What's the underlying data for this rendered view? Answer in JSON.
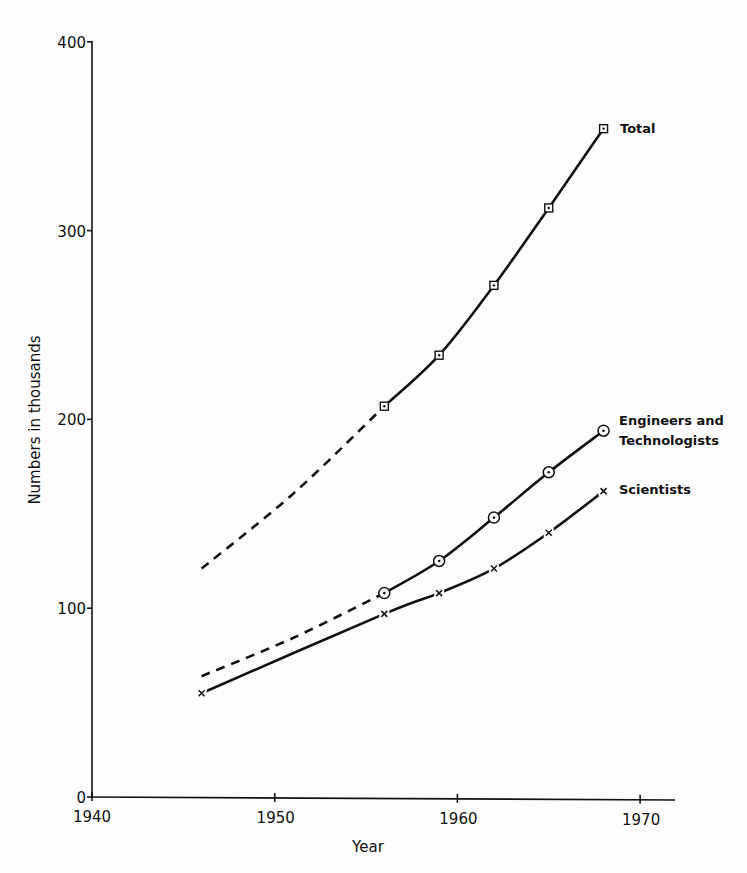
{
  "chart_data": {
    "type": "line",
    "title": "",
    "xlabel": "Year",
    "ylabel": "Numbers in thousands",
    "xlim": [
      1940,
      1972
    ],
    "ylim": [
      0,
      400
    ],
    "x_ticks": [
      1940,
      1950,
      1960,
      1970
    ],
    "x_tick_labels": [
      "1940",
      "1950",
      "1960",
      "1970"
    ],
    "y_ticks": [
      0,
      100,
      200,
      300,
      400
    ],
    "y_tick_labels": [
      "0",
      "100",
      "200",
      "300",
      "400"
    ],
    "grid": false,
    "legend_position": "inline labels at right end of each line",
    "series": [
      {
        "name": "Total",
        "marker": "square-dot",
        "estimated_start": {
          "x": 1946,
          "y": 121
        },
        "dashed_segment": [
          [
            1946,
            121
          ],
          [
            1956,
            207
          ]
        ],
        "x": [
          1956,
          1959,
          1962,
          1965,
          1968
        ],
        "values": [
          207,
          234,
          271,
          312,
          354
        ]
      },
      {
        "name": "Engineers and Technologists",
        "marker": "circle-dot",
        "estimated_start": {
          "x": 1946,
          "y": 64
        },
        "dashed_segment": [
          [
            1946,
            64
          ],
          [
            1956,
            108
          ]
        ],
        "x": [
          1956,
          1959,
          1962,
          1965,
          1968
        ],
        "values": [
          108,
          125,
          148,
          172,
          194
        ]
      },
      {
        "name": "Scientists",
        "marker": "x",
        "x": [
          1946,
          1956,
          1959,
          1962,
          1965,
          1968
        ],
        "values": [
          55,
          97,
          108,
          121,
          140,
          162
        ]
      }
    ]
  },
  "labels": {
    "total": "Total",
    "engineers_line1": "Engineers and",
    "engineers_line2": "Technologists",
    "scientists": "Scientists"
  }
}
